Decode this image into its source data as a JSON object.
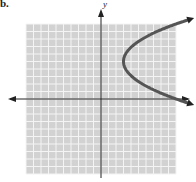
{
  "problem_label": "b.",
  "colors": {
    "grid_background": "#d2d2d2",
    "grid_lines": "#f4f4f4",
    "axes": "#222222",
    "curve": "#555555"
  },
  "chart_data": {
    "type": "line",
    "title": "",
    "xlabel": "",
    "ylabel": "y",
    "xlim": [
      -10,
      10
    ],
    "ylim": [
      -10,
      10
    ],
    "grid": true,
    "grid_step": 1,
    "legend": null,
    "series": [
      {
        "name": "parabola opening right",
        "description": "x = 0.28*(y-5)^2 + 3, vertex (3, 5)",
        "vertex": [
          3,
          5
        ],
        "x": [
          10,
          8.1,
          6.6,
          5.5,
          4.6,
          3.8,
          3.3,
          3,
          3.3,
          3.8,
          4.6,
          5.5,
          6.6,
          8.1,
          10
        ],
        "y": [
          10,
          9.3,
          8.6,
          8,
          7.4,
          6.7,
          6,
          5,
          4,
          3.3,
          2.6,
          2,
          1.4,
          0.7,
          0
        ],
        "arrows_at_ends": true
      }
    ]
  }
}
